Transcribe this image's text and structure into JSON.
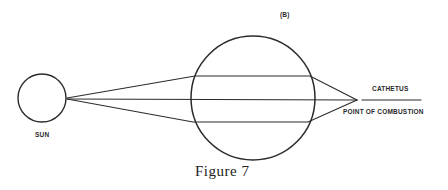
{
  "figure": {
    "panel_label": "(B)",
    "caption": "Figure 7",
    "labels": {
      "sun": "SUN",
      "cathetus": "CATHETUS",
      "point_of_combustion": "POINT OF COMBUSTION"
    },
    "colors": {
      "line": "#2b2b2b",
      "background": "#ffffff"
    },
    "elements": {
      "sun_circle": {
        "cx": 42,
        "cy": 98,
        "r": 24
      },
      "lens_circle": {
        "cx": 253,
        "cy": 98,
        "r": 62
      },
      "focus_point": {
        "x": 357,
        "y": 100
      },
      "cathetus_line": {
        "x1": 362,
        "y1": 100,
        "x2": 421,
        "y2": 100
      }
    }
  }
}
